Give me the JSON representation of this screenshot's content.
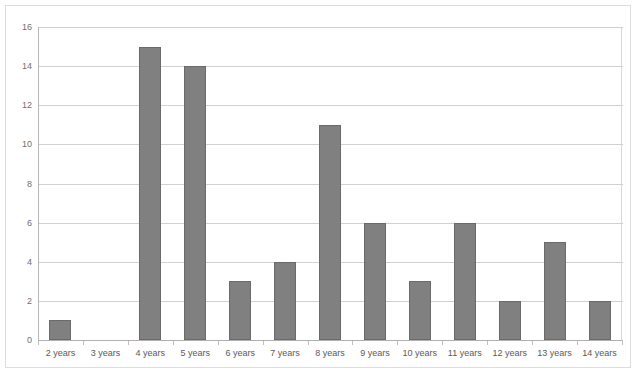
{
  "chart_data": {
    "type": "bar",
    "title": "",
    "subtitle": "",
    "xlabel": "",
    "ylabel": "",
    "categories": [
      "2 years",
      "3 years",
      "4 years",
      "5 years",
      "6 years",
      "7 years",
      "8 years",
      "9 years",
      "10 years",
      "11 years",
      "12 years",
      "13 years",
      "14 years"
    ],
    "values": [
      1,
      0,
      15,
      14,
      3,
      4,
      11,
      6,
      3,
      6,
      2,
      5,
      2
    ],
    "ylim": [
      0,
      16
    ],
    "ytick_values": [
      0,
      2,
      4,
      6,
      8,
      10,
      12,
      14,
      16
    ],
    "ytick_labels": [
      "0",
      "2",
      "4",
      "6",
      "8",
      "10",
      "12",
      "14",
      "16"
    ],
    "grid": "horizontal",
    "legend": "none",
    "series": [
      {
        "name": "",
        "values": [
          1,
          0,
          15,
          14,
          3,
          4,
          11,
          6,
          3,
          6,
          2,
          5,
          2
        ]
      }
    ],
    "colors": {
      "bar_fill": "#808080",
      "bar_border": "#6a6a6a",
      "gridline": "#d0d0d0",
      "axis": "#b0b0b0",
      "plot_background": "#ffffff",
      "tick_label": "#595959",
      "frame": "#dcdcdc"
    }
  }
}
